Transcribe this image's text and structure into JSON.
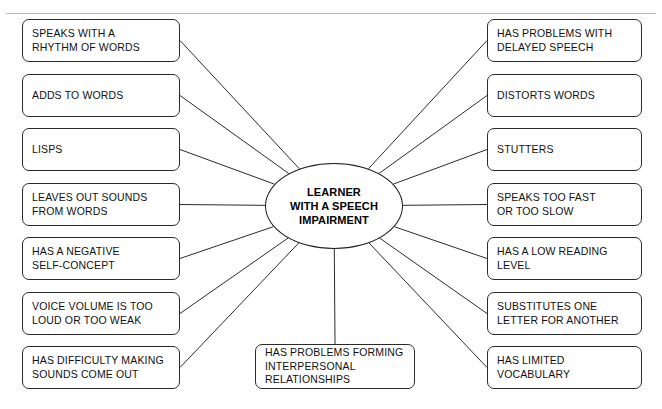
{
  "diagram": {
    "type": "radial-concept-map",
    "hub": {
      "label": "LEARNER\nWITH A SPEECH\nIMPAIRMENT",
      "center_x": 334,
      "center_y": 206,
      "rx": 69,
      "ry": 43
    },
    "line_color": "#2b2b2b",
    "box_border_color": "#2b2b2b",
    "background": "#ffffff",
    "left_nodes": [
      {
        "label": "SPEAKS WITH A\nRHYTHM OF WORDS",
        "x": 22,
        "y": 19,
        "w": 158,
        "h": 43
      },
      {
        "label": "ADDS TO WORDS",
        "x": 22,
        "y": 74,
        "w": 158,
        "h": 43
      },
      {
        "label": "LISPS",
        "x": 22,
        "y": 128,
        "w": 158,
        "h": 43
      },
      {
        "label": "LEAVES OUT SOUNDS\nFROM WORDS",
        "x": 22,
        "y": 183,
        "w": 158,
        "h": 43
      },
      {
        "label": "HAS A NEGATIVE\nSELF-CONCEPT",
        "x": 22,
        "y": 237,
        "w": 158,
        "h": 43
      },
      {
        "label": "VOICE VOLUME IS TOO\nLOUD OR TOO WEAK",
        "x": 22,
        "y": 292,
        "w": 158,
        "h": 43
      },
      {
        "label": "HAS DIFFICULTY MAKING\nSOUNDS COME OUT",
        "x": 22,
        "y": 346,
        "w": 158,
        "h": 43
      }
    ],
    "right_nodes": [
      {
        "label": "HAS PROBLEMS WITH\nDELAYED SPEECH",
        "x": 487,
        "y": 19,
        "w": 155,
        "h": 43
      },
      {
        "label": "DISTORTS WORDS",
        "x": 487,
        "y": 74,
        "w": 155,
        "h": 43
      },
      {
        "label": "STUTTERS",
        "x": 487,
        "y": 128,
        "w": 155,
        "h": 43
      },
      {
        "label": "SPEAKS TOO FAST\nOR TOO SLOW",
        "x": 487,
        "y": 183,
        "w": 155,
        "h": 43
      },
      {
        "label": "HAS A LOW READING\nLEVEL",
        "x": 487,
        "y": 237,
        "w": 155,
        "h": 43
      },
      {
        "label": "SUBSTITUTES ONE\nLETTER FOR ANOTHER",
        "x": 487,
        "y": 292,
        "w": 155,
        "h": 43
      },
      {
        "label": "HAS LIMITED\nVOCABULARY",
        "x": 487,
        "y": 346,
        "w": 155,
        "h": 43
      }
    ],
    "bottom_nodes": [
      {
        "label": "HAS PROBLEMS FORMING\nINTERPERSONAL\nRELATIONSHIPS",
        "x": 255,
        "y": 344,
        "w": 160,
        "h": 45
      }
    ]
  }
}
